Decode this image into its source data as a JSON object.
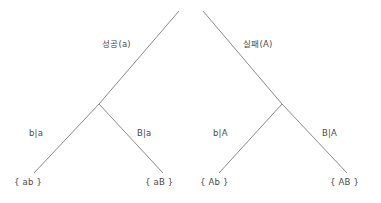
{
  "diagram": {
    "type": "probability-tree",
    "background_color": "#ffffff",
    "line_color": "#8a8a8a",
    "text_color": "#4a4a4a",
    "trees": [
      {
        "name": "success-tree",
        "root_label": "성공(a)",
        "branches": [
          {
            "name": "left",
            "label": "b|a",
            "leaf": "{ ab }"
          },
          {
            "name": "right",
            "label": "B|a",
            "leaf": "{ aB }"
          }
        ]
      },
      {
        "name": "failure-tree",
        "root_label": "실패(A)",
        "branches": [
          {
            "name": "left",
            "label": "b|A",
            "leaf": "{ Ab }"
          },
          {
            "name": "right",
            "label": "B|A",
            "leaf": "{ AB }"
          }
        ]
      }
    ]
  },
  "labels": {
    "tree1_root": "성공(a)",
    "tree1_branch_left": "b|a",
    "tree1_branch_right": "B|a",
    "tree1_leaf_left": "{ ab }",
    "tree1_leaf_right": "{ aB }",
    "tree2_root": "실패(A)",
    "tree2_branch_left": "b|A",
    "tree2_branch_right": "B|A",
    "tree2_leaf_left": "{ Ab }",
    "tree2_leaf_right": "{ AB }"
  }
}
